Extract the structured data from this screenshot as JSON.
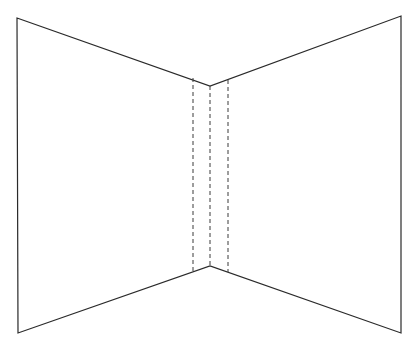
{
  "diagram": {
    "colors": {
      "background": "#ffffff",
      "stroke": "#2a2a2a",
      "dash": "#3a3a3a"
    },
    "outline": {
      "top_left": [
        17,
        18
      ],
      "top_center": [
        210,
        86
      ],
      "top_right": [
        401,
        16
      ],
      "bottom_right": [
        401,
        333
      ],
      "bottom_center": [
        210,
        266
      ],
      "bottom_left": [
        18,
        333
      ]
    },
    "corner_line": {
      "x": 210,
      "y1": 86,
      "y2": 266
    },
    "dashed_lines": [
      {
        "x": 193,
        "y1": 78,
        "y2": 272
      },
      {
        "x": 210,
        "y1": 86,
        "y2": 266
      },
      {
        "x": 228,
        "y1": 80,
        "y2": 272
      }
    ]
  }
}
